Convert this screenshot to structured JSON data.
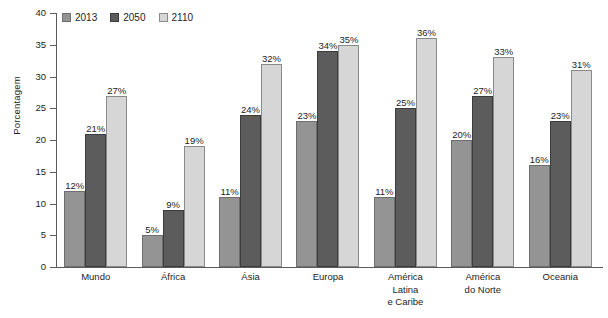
{
  "chart_data": {
    "type": "bar",
    "title": "",
    "xlabel": "",
    "ylabel": "Porcentagem",
    "ylim": [
      0,
      40
    ],
    "ytick_step": 5,
    "yticks": [
      40,
      35,
      30,
      25,
      20,
      15,
      10,
      5,
      0
    ],
    "grid": false,
    "legend_position": "top-left",
    "value_label_suffix": "%",
    "categories": [
      "Mundo",
      "África",
      "Ásia",
      "Europa",
      "América Latina e Caribe",
      "América do Norte",
      "Oceania"
    ],
    "category_lines": [
      [
        "Mundo"
      ],
      [
        "África"
      ],
      [
        "Ásia"
      ],
      [
        "Europa"
      ],
      [
        "América",
        "Latina",
        "e Caribe"
      ],
      [
        "América",
        "do Norte"
      ],
      [
        "Oceania"
      ]
    ],
    "series": [
      {
        "name": "2013",
        "color": "#949494",
        "values": [
          12,
          5,
          11,
          23,
          11,
          20,
          16
        ],
        "labels": [
          "12%",
          "5%",
          "11%",
          "23%",
          "11%",
          "20%",
          "16%"
        ]
      },
      {
        "name": "2050",
        "color": "#5c5c5c",
        "values": [
          21,
          9,
          24,
          34,
          25,
          27,
          23
        ],
        "labels": [
          "21%",
          "9%",
          "24%",
          "34%",
          "25%",
          "27%",
          "23%"
        ]
      },
      {
        "name": "2110",
        "color": "#d6d6d6",
        "values": [
          27,
          19,
          32,
          35,
          36,
          33,
          31
        ],
        "labels": [
          "27%",
          "19%",
          "32%",
          "35%",
          "36%",
          "33%",
          "31%"
        ]
      }
    ]
  }
}
